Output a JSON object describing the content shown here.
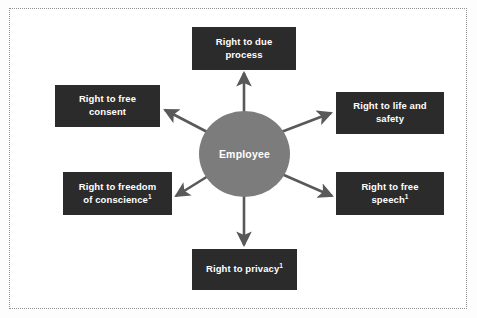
{
  "diagram": {
    "frame_style": "dotted",
    "frame_color": "#8e8e8e",
    "background_color": "#ffffff",
    "node_color": "#2b2b2b",
    "hub_color": "#7c7c7c",
    "arrow_color": "#595959",
    "text_color": "#ffffff"
  },
  "hub": {
    "label": "Employee"
  },
  "nodes": [
    {
      "id": "due-process",
      "line1": "Right to due",
      "line2": "process",
      "footnote": ""
    },
    {
      "id": "free-consent",
      "line1": "Right to free",
      "line2": "consent",
      "footnote": ""
    },
    {
      "id": "life-safety",
      "line1": "Right to life and",
      "line2": "safety",
      "footnote": ""
    },
    {
      "id": "conscience",
      "line1": "Right to freedom",
      "line2": "of conscience",
      "footnote": "1"
    },
    {
      "id": "free-speech",
      "line1": "Right to free",
      "line2": "speech",
      "footnote": "1"
    },
    {
      "id": "privacy",
      "line1": "Right to privacy",
      "line2": "",
      "footnote": "1"
    }
  ]
}
